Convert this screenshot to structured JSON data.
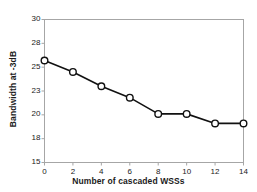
{
  "chart_data": {
    "type": "line",
    "title": "",
    "xlabel": "Number of cascaded WSSs",
    "ylabel": "Bandwidth at -3dB",
    "x": [
      0,
      2,
      4,
      6,
      8,
      10,
      12,
      14
    ],
    "values": [
      25.7,
      24.5,
      23.0,
      21.8,
      20.1,
      20.1,
      19.1,
      19.1
    ],
    "series": [
      {
        "name": "Bandwidth at -3dB",
        "values": [
          25.7,
          24.5,
          23.0,
          21.8,
          20.1,
          20.1,
          19.1,
          19.1
        ]
      }
    ],
    "xlim": [
      0,
      14
    ],
    "ylim": [
      15,
      30
    ],
    "xticks": [
      0,
      2,
      4,
      6,
      8,
      10,
      12,
      14
    ],
    "xtick_labels": [
      "0",
      "2",
      "4",
      "6",
      "8",
      "10",
      "12",
      "14"
    ],
    "yticks": [
      15,
      17.5,
      20,
      22.5,
      25,
      27.5,
      30
    ],
    "ytick_labels": [
      "15",
      "18",
      "20",
      "23",
      "25",
      "28",
      "30"
    ],
    "grid": false,
    "legend": false,
    "marker": "open-circle",
    "line_color": "#111111",
    "marker_face_color": "#ffffff",
    "marker_edge_color": "#111111",
    "plot_background": "#ffffff",
    "frame_color": "#a6a6a6"
  }
}
